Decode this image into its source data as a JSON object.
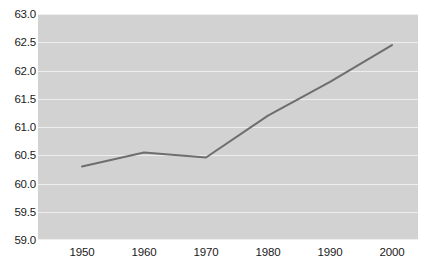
{
  "chart_data": {
    "type": "line",
    "title": "",
    "subtitle": "",
    "xlabel": "",
    "ylabel": "",
    "x": [
      1950,
      1960,
      1970,
      1980,
      1990,
      2000
    ],
    "categories": [
      "1950",
      "1960",
      "1970",
      "1980",
      "1990",
      "2000"
    ],
    "values": [
      60.3,
      60.55,
      60.46,
      61.2,
      61.8,
      62.45
    ],
    "series": [
      {
        "name": "series-1",
        "values": [
          60.3,
          60.55,
          60.46,
          61.2,
          61.8,
          62.45
        ]
      }
    ],
    "xlim": [
      1950,
      2000
    ],
    "ylim": [
      59.0,
      63.0
    ],
    "ytick_labels": [
      "63.0",
      "62.5",
      "62.0",
      "61.5",
      "61.0",
      "60.5",
      "60.0",
      "59.5",
      "59.0"
    ],
    "ytick_values": [
      63.0,
      62.5,
      62.0,
      61.5,
      61.0,
      60.5,
      60.0,
      59.5,
      59.0
    ],
    "xtick_labels": [
      "1950",
      "1960",
      "1970",
      "1980",
      "1990",
      "2000"
    ],
    "xtick_values": [
      1950,
      1960,
      1970,
      1980,
      1990,
      2000
    ],
    "grid": true,
    "grid_axis": "y",
    "legend": false,
    "legend_position": "none",
    "annotations": []
  },
  "style": {
    "plot_background": "#d2d2d2",
    "page_background": "#ffffff",
    "gridline_color": "#eeeeee",
    "line_color": "#6e6e6e",
    "tick_label_color": "#1a1a1a",
    "line_width": "2"
  }
}
